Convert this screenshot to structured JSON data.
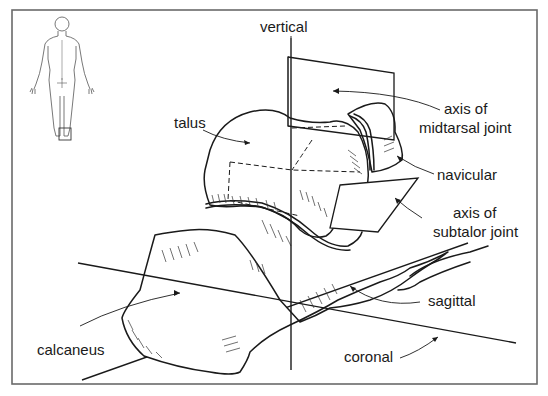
{
  "figure": {
    "inset": {
      "name": "body-figure",
      "highlight": "right-foot-region"
    },
    "labels": {
      "vertical": "vertical",
      "talus": "talus",
      "midtarsal_line1": "axis of",
      "midtarsal_line2": "midtarsal joint",
      "navicular": "navicular",
      "subtalar_line1": "axis of",
      "subtalar_line2": "subtalor joint",
      "sagittal": "sagittal",
      "calcaneus": "calcaneus",
      "coronal": "coronal"
    },
    "colors": {
      "ink": "#1a1a1a",
      "frame": "#6a6a6a",
      "background": "#ffffff"
    }
  }
}
